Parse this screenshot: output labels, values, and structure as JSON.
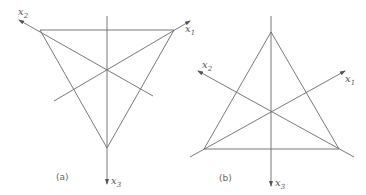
{
  "figure": {
    "panels": [
      {
        "id": "a",
        "caption": "(a)",
        "axes": {
          "x1": {
            "base": "x",
            "sub": "1"
          },
          "x2": {
            "base": "x",
            "sub": "2"
          },
          "x3": {
            "base": "x",
            "sub": "3"
          }
        }
      },
      {
        "id": "b",
        "caption": "(b)",
        "axes": {
          "x1": {
            "base": "x",
            "sub": "1"
          },
          "x2": {
            "base": "x",
            "sub": "2"
          },
          "x3": {
            "base": "x",
            "sub": "3"
          }
        }
      }
    ],
    "colors": {
      "line": "#6a6a6a",
      "text": "#555555",
      "background": "#ffffff"
    }
  }
}
